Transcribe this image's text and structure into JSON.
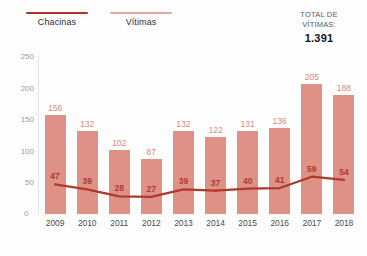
{
  "legend": {
    "items": [
      {
        "label": "Chacinas",
        "color": "#a8372b",
        "name": "legend-chacinas"
      },
      {
        "label": "Vítimas",
        "color": "#e0aaa2",
        "name": "legend-vitimas"
      }
    ]
  },
  "total": {
    "label_line1": "TOTAL DE",
    "label_line2": "VÍTIMAS:",
    "value": "1.391"
  },
  "colors": {
    "bar": "#de9287",
    "bar_label": "#d98a80",
    "line": "#b0382c",
    "line_label": "#b0382c",
    "axis": "#e2e2e2",
    "tick_text": "#9b9b9b",
    "x_text": "#4d4d4d",
    "background": "#fdfdfd"
  },
  "chart_data": {
    "type": "bar",
    "title": "",
    "subtitle": "",
    "xlabel": "",
    "ylabel": "",
    "ylim": [
      0,
      250
    ],
    "yticks": [
      250,
      200,
      150,
      100,
      50,
      0
    ],
    "grid": false,
    "legend_position": "top-left",
    "categories": [
      "2009",
      "2010",
      "2011",
      "2012",
      "2013",
      "2014",
      "2015",
      "2016",
      "2017",
      "2018"
    ],
    "series": [
      {
        "name": "Vítimas",
        "type": "bar",
        "values": [
          156,
          132,
          102,
          87,
          132,
          122,
          131,
          136,
          205,
          188
        ]
      },
      {
        "name": "Chacinas",
        "type": "line",
        "values": [
          47,
          39,
          28,
          27,
          39,
          37,
          40,
          41,
          59,
          54
        ]
      }
    ],
    "annotations": [
      {
        "text": "TOTAL DE VÍTIMAS:",
        "value": "1.391"
      }
    ]
  }
}
